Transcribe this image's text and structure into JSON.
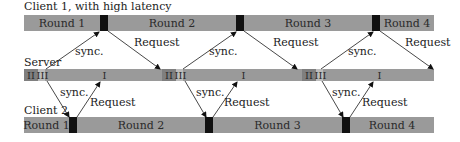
{
  "title": "Client 1, with high latency",
  "labels": {
    "server": "Server",
    "client2": "Client 2"
  },
  "client1": {
    "rounds": [
      "Round 1",
      "Round 2",
      "Round 3",
      "Round 4"
    ]
  },
  "server": {
    "phases": {
      "p2": "II",
      "p3": "III",
      "p1": "I"
    }
  },
  "client2": {
    "rounds": [
      "Round 1",
      "Round 2",
      "Round 3",
      "Round 4"
    ]
  },
  "arrows": {
    "sync": "sync.",
    "request": "Request"
  },
  "colors": {
    "bar": "#9a9a9a",
    "marker": "#111111",
    "phase_dark": "#7f7f7f",
    "phase_light": "#bdbdbd"
  }
}
